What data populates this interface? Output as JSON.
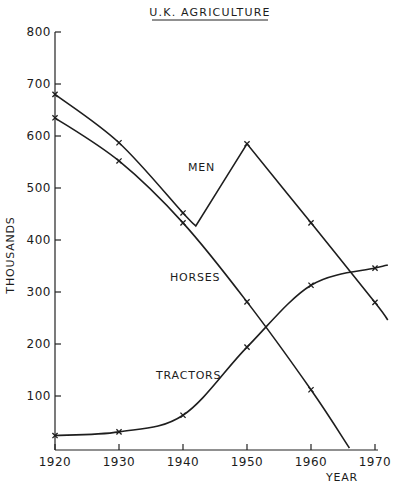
{
  "chart_data": {
    "type": "line",
    "title": "U.K. AGRICULTURE",
    "xlabel": "YEAR",
    "ylabel": "THOUSANDS",
    "x_ticks": [
      "1920",
      "1930",
      "1940",
      "1950",
      "1960",
      "1970"
    ],
    "y_ticks": [
      "100",
      "200",
      "300",
      "400",
      "500",
      "600",
      "700",
      "800"
    ],
    "xlim": [
      1920,
      1972
    ],
    "ylim": [
      0,
      800
    ],
    "grid": false,
    "legend": "inline labels",
    "series": [
      {
        "name": "MEN",
        "x": [
          1920,
          1930,
          1940,
          1942,
          1950,
          1960,
          1970,
          1972
        ],
        "values": [
          680,
          587,
          452,
          427,
          585,
          433,
          280,
          246
        ],
        "markers_at": [
          1920,
          1930,
          1940,
          1950,
          1960,
          1970
        ]
      },
      {
        "name": "HORSES",
        "x": [
          1920,
          1930,
          1940,
          1950,
          1960,
          1966
        ],
        "values": [
          635,
          552,
          433,
          281,
          112,
          0
        ],
        "markers_at": [
          1920,
          1930,
          1940,
          1950,
          1960
        ]
      },
      {
        "name": "TRACTORS",
        "x": [
          1920,
          1930,
          1940,
          1950,
          1960,
          1970,
          1972
        ],
        "values": [
          24,
          31,
          63,
          194,
          313,
          346,
          352
        ],
        "markers_at": [
          1920,
          1930,
          1940,
          1950,
          1960,
          1970
        ]
      }
    ]
  },
  "labels": {
    "title": "U.K. AGRICULTURE",
    "xlabel": "YEAR",
    "ylabel": "THOUSANDS",
    "men": "MEN",
    "horses": "HORSES",
    "tractors": "TRACTORS"
  }
}
